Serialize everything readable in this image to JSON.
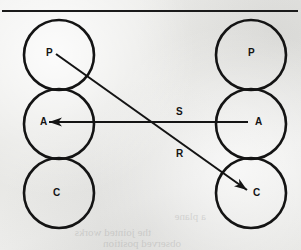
{
  "figure": {
    "background_color": "#e8e8e6",
    "ink_color": "#141414",
    "top_rule": {
      "x1": 2,
      "y1": 11,
      "x2": 298,
      "y2": 11,
      "width": 2
    },
    "columns": [
      {
        "name": "left-column",
        "cx": 59,
        "circles": [
          {
            "id": "left-p",
            "label": "P",
            "cy": 55,
            "r": 35
          },
          {
            "id": "left-a",
            "label": "A",
            "cy": 124,
            "r": 35
          },
          {
            "id": "left-c",
            "label": "C",
            "cy": 193,
            "r": 35
          }
        ]
      },
      {
        "name": "right-column",
        "cx": 251,
        "circles": [
          {
            "id": "right-p",
            "label": "P",
            "cy": 55,
            "r": 35
          },
          {
            "id": "right-a",
            "label": "A",
            "cy": 124,
            "r": 35
          },
          {
            "id": "right-c",
            "label": "C",
            "cy": 193,
            "r": 35
          }
        ]
      }
    ],
    "arrows": [
      {
        "id": "arrow-s",
        "label": "S",
        "from": "right-a",
        "to": "left-a",
        "x1": 248,
        "y1": 122,
        "x2": 49,
        "y2": 122,
        "label_x": 176,
        "label_y": 107
      },
      {
        "id": "arrow-r",
        "label": "R",
        "from": "left-p",
        "to": "right-c",
        "x1": 56,
        "y1": 54,
        "x2": 247,
        "y2": 190,
        "label_x": 176,
        "label_y": 149
      }
    ],
    "labels": {
      "left_p": "P",
      "left_a": "A",
      "left_c": "C",
      "right_p": "P",
      "right_a": "A",
      "right_c": "C",
      "edge_s": "S",
      "edge_r": "R"
    },
    "label_positions": {
      "left_p": {
        "x": 46,
        "y": 48
      },
      "left_a": {
        "x": 40,
        "y": 117
      },
      "left_c": {
        "x": 53,
        "y": 188
      },
      "right_p": {
        "x": 248,
        "y": 48
      },
      "right_a": {
        "x": 255,
        "y": 117
      },
      "right_c": {
        "x": 253,
        "y": 188
      }
    }
  }
}
